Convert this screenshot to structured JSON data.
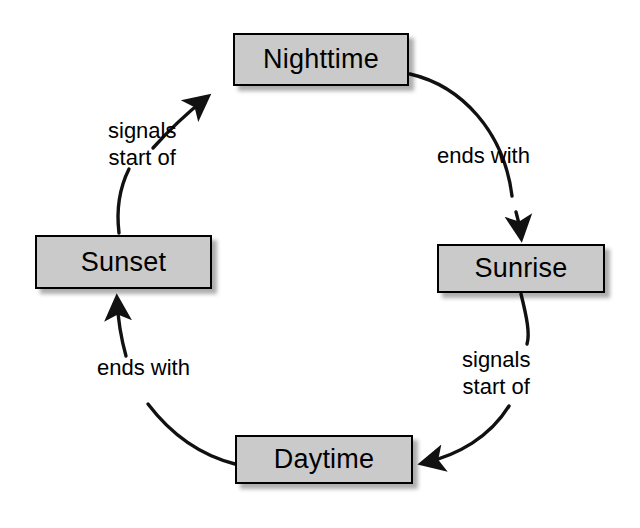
{
  "diagram": {
    "type": "cycle-diagram",
    "node_fill_color": "#cacaca",
    "node_border_color": "#000000",
    "edge_color": "#000000",
    "background_color": "#ffffff",
    "nodes": [
      {
        "id": "nighttime",
        "label": "Nighttime",
        "position": "top"
      },
      {
        "id": "sunrise",
        "label": "Sunrise",
        "position": "right"
      },
      {
        "id": "daytime",
        "label": "Daytime",
        "position": "bottom"
      },
      {
        "id": "sunset",
        "label": "Sunset",
        "position": "left"
      }
    ],
    "edges": [
      {
        "id": "nighttime-to-sunrise",
        "from": "Nighttime",
        "to": "Sunrise",
        "label": "ends with",
        "label_lines": [
          "ends with"
        ]
      },
      {
        "id": "sunrise-to-daytime",
        "from": "Sunrise",
        "to": "Daytime",
        "label": "signals start of",
        "label_lines": [
          "signals",
          "start of"
        ]
      },
      {
        "id": "daytime-to-sunset",
        "from": "Daytime",
        "to": "Sunset",
        "label": "ends with",
        "label_lines": [
          "ends with"
        ]
      },
      {
        "id": "sunset-to-nighttime",
        "from": "Sunset",
        "to": "Nighttime",
        "label": "signals start of",
        "label_lines": [
          "signals",
          "start of"
        ]
      }
    ],
    "labels": {
      "signals_start_of_top_line1": "signals",
      "signals_start_of_top_line2": "start of",
      "ends_with_right": "ends with",
      "signals_start_of_bottom_line1": "signals",
      "signals_start_of_bottom_line2": "start of",
      "ends_with_left": "ends with"
    }
  }
}
